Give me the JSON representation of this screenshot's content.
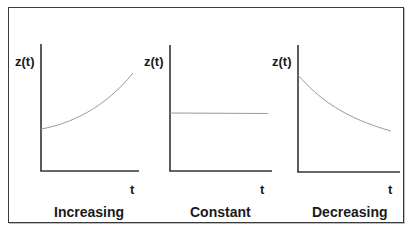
{
  "diagram": {
    "title": "",
    "panels": [
      {
        "id": "increasing",
        "ylabel": "z(t)",
        "xlabel": "t",
        "caption": "Increasing",
        "trend": "increasing",
        "curve_shape": "convex exponential growth"
      },
      {
        "id": "constant",
        "ylabel": "z(t)",
        "xlabel": "t",
        "caption": "Constant",
        "trend": "constant",
        "curve_shape": "horizontal line"
      },
      {
        "id": "decreasing",
        "ylabel": "z(t)",
        "xlabel": "t",
        "caption": "Decreasing",
        "trend": "decreasing",
        "curve_shape": "convex exponential decay"
      }
    ],
    "colors": {
      "axis": "#333333",
      "curve": "#9a9a9a",
      "text": "#1a1a1a",
      "frame": "#3a3a3a",
      "background": "#ffffff"
    }
  }
}
